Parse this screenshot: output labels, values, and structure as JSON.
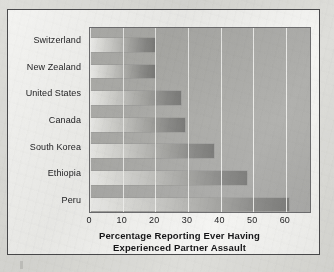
{
  "chart_data": {
    "type": "bar",
    "orientation": "horizontal",
    "title": "",
    "xlabel": "Percentage Reporting Ever Having Experienced Partner Assault",
    "xlabel_lines": [
      "Percentage Reporting Ever Having",
      "Experienced Partner Assault"
    ],
    "ylabel": "",
    "categories": [
      "Switzerland",
      "New Zealand",
      "United States",
      "Canada",
      "South Korea",
      "Ethiopia",
      "Peru"
    ],
    "values": [
      20,
      20,
      28,
      29,
      38,
      48,
      61
    ],
    "xlim": [
      0,
      68
    ],
    "xticks": [
      0,
      10,
      20,
      30,
      40,
      50,
      60
    ],
    "xtick_labels": [
      "0",
      "10",
      "20",
      "30",
      "40",
      "50",
      "60"
    ],
    "grid": "vertical-only",
    "legend": "none",
    "bar_fill": "horizontal-gradient-light-to-dark",
    "plot_background": "#b0b0ad",
    "gridline_color": "#f6f6f4",
    "frame_color": "#4a4a4c",
    "page_background": "#dededa"
  }
}
